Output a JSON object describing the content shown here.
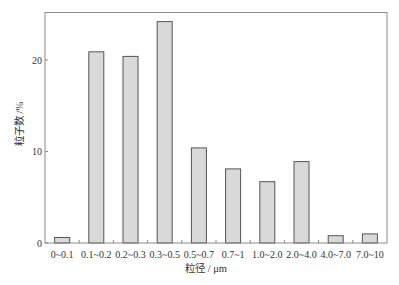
{
  "chart_data": {
    "type": "bar",
    "title": "",
    "xlabel": "粒径 / μm",
    "ylabel": "粒子数 /%",
    "categories": [
      "0~0.1",
      "0.1~0.2",
      "0.2~0.3",
      "0.3~0.5",
      "0.5~0.7",
      "0.7~1",
      "1.0~2.0",
      "2.0~4.0",
      "4.0~7.0",
      "7.0~10"
    ],
    "values": [
      0.6,
      20.9,
      20.4,
      24.2,
      10.4,
      8.1,
      6.7,
      8.9,
      0.8,
      1.0
    ],
    "ylim": [
      0,
      25.2
    ],
    "yticks": [
      0,
      10,
      20
    ],
    "grid": false,
    "legend": null,
    "colors": {
      "bar_fill": "#d9d9d9",
      "bar_stroke": "#555555",
      "axis": "#888888"
    }
  }
}
